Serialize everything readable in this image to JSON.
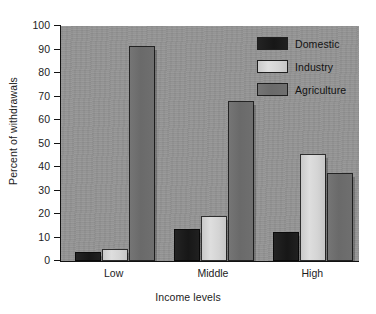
{
  "chart_data": {
    "type": "bar",
    "title": "",
    "xlabel": "Income levels",
    "ylabel": "Percent of withdrawals",
    "categories": [
      "Low",
      "Middle",
      "High"
    ],
    "series": [
      {
        "name": "Domestic",
        "color": "#1a1a1a",
        "values": [
          4,
          13.5,
          12.5
        ]
      },
      {
        "name": "Industry",
        "color": "#d4d4d4",
        "values": [
          5,
          19,
          45.5
        ]
      },
      {
        "name": "Agriculture",
        "color": "#6b6b6b",
        "values": [
          91.5,
          68,
          37.5
        ]
      }
    ],
    "ylim": [
      0,
      100
    ],
    "yticks": [
      0,
      10,
      20,
      30,
      40,
      50,
      60,
      70,
      80,
      90,
      100
    ],
    "ytick_labels": [
      "0",
      "10",
      "20",
      "30",
      "40",
      "50",
      "60",
      "70",
      "80",
      "90",
      "100"
    ],
    "grid": false,
    "legend_position": "top-right",
    "plot_background_color": "#939393",
    "figure_background_color": "#ffffff",
    "axis_color": "#111111"
  },
  "legend": {
    "entries": [
      {
        "label": "Domestic"
      },
      {
        "label": "Industry"
      },
      {
        "label": "Agriculture"
      }
    ]
  }
}
